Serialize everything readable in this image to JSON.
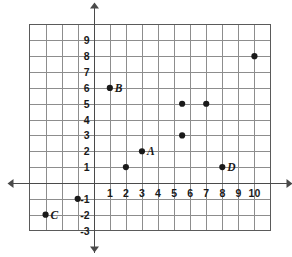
{
  "chart_data": {
    "type": "scatter",
    "title": "",
    "xlabel": "",
    "ylabel": "",
    "xlim": [
      -4,
      11
    ],
    "ylim": [
      -3,
      10
    ],
    "grid": true,
    "legend": "none",
    "x_ticks": [
      1,
      2,
      3,
      4,
      5,
      6,
      7,
      8,
      9,
      10
    ],
    "y_ticks": [
      9,
      8,
      7,
      6,
      5,
      4,
      3,
      2,
      1,
      -1,
      -2,
      -3
    ],
    "x_tick_labels": [
      "1",
      "2",
      "3",
      "4",
      "5",
      "6",
      "7",
      "8",
      "9",
      "10"
    ],
    "y_tick_labels": [
      "9",
      "8",
      "7",
      "6",
      "5",
      "4",
      "3",
      "2",
      "1",
      "-1",
      "-2",
      "-3"
    ],
    "points": [
      {
        "label": "B",
        "x": 1,
        "y": 6
      },
      {
        "label": "A",
        "x": 3,
        "y": 2
      },
      {
        "label": "C",
        "x": -3,
        "y": -2
      },
      {
        "label": "D",
        "x": 8,
        "y": 1
      },
      {
        "label": "",
        "x": 2,
        "y": 1
      },
      {
        "label": "",
        "x": -1,
        "y": -1
      },
      {
        "label": "",
        "x": 5.5,
        "y": 5
      },
      {
        "label": "",
        "x": 5.5,
        "y": 3
      },
      {
        "label": "",
        "x": 7,
        "y": 5
      },
      {
        "label": "",
        "x": 10,
        "y": 8
      }
    ]
  },
  "colors": {
    "grid": "#8d8d8d",
    "border": "#5a5a5a",
    "axis": "#4a4a4a",
    "point": "#1a1a1a",
    "background": "#ffffff"
  }
}
